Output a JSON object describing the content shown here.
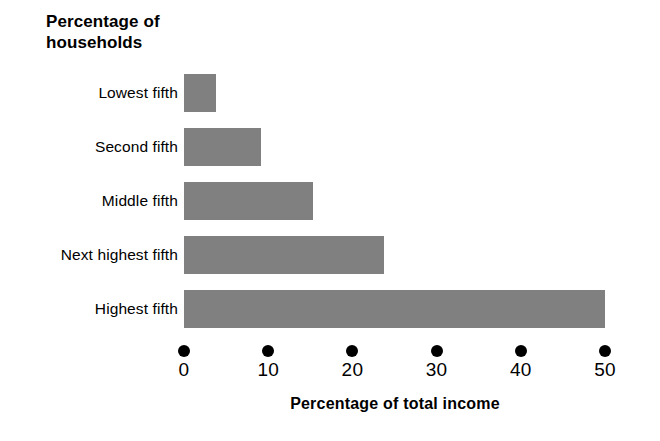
{
  "chart_data": {
    "type": "bar",
    "orientation": "horizontal",
    "title": "Percentage of\nhouseholds",
    "subtitle": "",
    "xlabel": "Percentage of total income",
    "ylabel": "Percentage of households",
    "categories": [
      "Lowest fifth",
      "Second fifth",
      "Middle fifth",
      "Next highest fifth",
      "Highest fifth"
    ],
    "values": [
      3.8,
      9.2,
      15.3,
      23.7,
      50.0
    ],
    "xlim": [
      0,
      50
    ],
    "xticks": [
      0,
      10,
      20,
      30,
      40,
      50
    ],
    "xtick_labels": [
      "0",
      "10",
      "20",
      "30",
      "40",
      "50"
    ],
    "grid": false,
    "legend": false,
    "bar_color": "#808080",
    "axis_color": "#000000",
    "background_color": "#ffffff",
    "tick_marker": "filled-circle"
  }
}
